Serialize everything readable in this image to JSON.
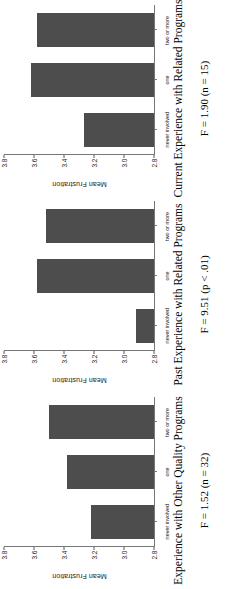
{
  "figure": {
    "orientation_note": "rotated",
    "bar_color": "#4d4d4d",
    "axis_color": "#777777"
  },
  "chart_data": [
    {
      "type": "bar",
      "title": "Experience with Other Quality Programs",
      "xlabel": "",
      "ylabel": "Mean Frustration",
      "categories": [
        "never involved",
        "one",
        "two or more"
      ],
      "values": [
        3.22,
        3.38,
        3.5
      ],
      "ylim": [
        2.8,
        3.8
      ],
      "yticks": [
        "2.8",
        "3.0",
        "3.2",
        "3.4",
        "3.6",
        "3.8"
      ],
      "grid": false,
      "legend": "none",
      "annotation": "F = 1.52 (n = 32)"
    },
    {
      "type": "bar",
      "title": "Past Experience with Related Programs",
      "xlabel": "",
      "ylabel": "Mean Frustration",
      "categories": [
        "never involved",
        "one",
        "two or more"
      ],
      "values": [
        2.92,
        3.58,
        3.52
      ],
      "ylim": [
        2.8,
        3.8
      ],
      "yticks": [
        "2.8",
        "3.0",
        "3.2",
        "3.4",
        "3.6",
        "3.8"
      ],
      "grid": false,
      "legend": "none",
      "annotation": "F = 9.51 (p < .01)"
    },
    {
      "type": "bar",
      "title": "Current Experience with Related Programs",
      "xlabel": "",
      "ylabel": "Mean Frustration",
      "categories": [
        "never involved",
        "one",
        "two or more"
      ],
      "values": [
        3.27,
        3.62,
        3.58
      ],
      "ylim": [
        2.8,
        3.8
      ],
      "yticks": [
        "2.8",
        "3.0",
        "3.2",
        "3.4",
        "3.6",
        "3.8"
      ],
      "grid": false,
      "legend": "none",
      "annotation": "F = 1.90 (n = 15)"
    }
  ]
}
